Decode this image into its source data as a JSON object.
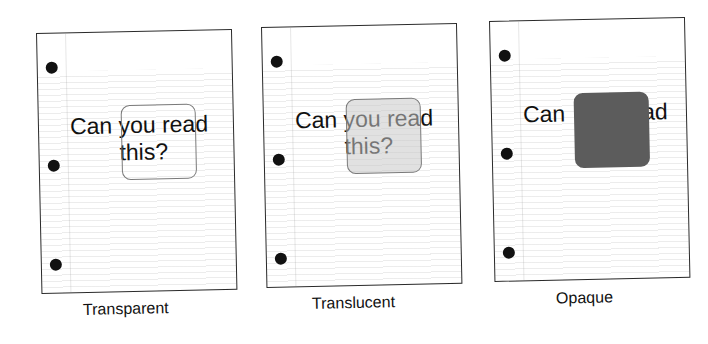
{
  "figure": {
    "panels": [
      {
        "id": "transparent",
        "caption": "Transparent",
        "text_line1": "Can you read",
        "text_line2": "this?",
        "overlay_style": "transparent outlined rounded square",
        "overlay_color": "transparent",
        "text_visible_through_overlay": true
      },
      {
        "id": "translucent",
        "caption": "Translucent",
        "text_line1": "Can you read",
        "text_line2": "this?",
        "overlay_style": "semi-transparent light grey rounded square",
        "overlay_color": "#c8c8c8",
        "text_visible_through_overlay": true
      },
      {
        "id": "opaque",
        "caption": "Opaque",
        "text_line1_left": "Can",
        "text_line1_right": "ad",
        "overlay_style": "solid dark grey rounded square",
        "overlay_color": "#5c5c5c",
        "text_visible_through_overlay": false
      }
    ],
    "colors": {
      "page_border": "#2a2a2a",
      "hole": "#111111",
      "text": "#111111",
      "panel_outline": "#7a7a7a",
      "opaque_fill": "#5c5c5c"
    }
  }
}
